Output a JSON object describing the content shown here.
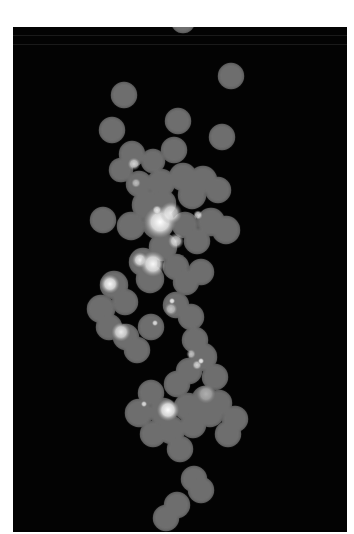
{
  "image": {
    "description": "Grayscale fluorescence-style micrograph: chain of overlapping gray discs with bright highlight spots",
    "background": "#030303",
    "page_background": "#ffffff",
    "disc_color": "#6e6e6e",
    "disc_edge_color": "#5a5a5a",
    "highlight_color": "#f4f4f4",
    "frame": {
      "x": 13,
      "y": 27,
      "width": 334,
      "height": 505
    },
    "scanlines_y": [
      8,
      17
    ]
  },
  "discs": [
    [
      170,
      -6,
      11
    ],
    [
      111,
      68,
      12
    ],
    [
      218,
      49,
      12
    ],
    [
      99,
      103,
      12
    ],
    [
      165,
      94,
      12
    ],
    [
      209,
      110,
      12
    ],
    [
      161,
      123,
      12
    ],
    [
      119,
      127,
      12
    ],
    [
      108,
      143,
      11
    ],
    [
      140,
      134,
      11
    ],
    [
      126,
      157,
      12
    ],
    [
      148,
      156,
      13
    ],
    [
      170,
      150,
      13
    ],
    [
      190,
      153,
      13
    ],
    [
      205,
      163,
      12
    ],
    [
      179,
      168,
      13
    ],
    [
      90,
      193,
      12
    ],
    [
      134,
      178,
      14
    ],
    [
      150,
      176,
      12
    ],
    [
      118,
      199,
      13
    ],
    [
      145,
      196,
      15
    ],
    [
      172,
      198,
      12
    ],
    [
      198,
      195,
      13
    ],
    [
      213,
      203,
      13
    ],
    [
      184,
      214,
      12
    ],
    [
      150,
      220,
      13
    ],
    [
      130,
      235,
      13
    ],
    [
      163,
      240,
      12
    ],
    [
      137,
      252,
      13
    ],
    [
      101,
      258,
      13
    ],
    [
      88,
      282,
      13
    ],
    [
      112,
      275,
      12
    ],
    [
      173,
      255,
      12
    ],
    [
      188,
      245,
      12
    ],
    [
      163,
      278,
      12
    ],
    [
      178,
      290,
      12
    ],
    [
      96,
      300,
      12
    ],
    [
      113,
      310,
      12
    ],
    [
      138,
      300,
      12
    ],
    [
      124,
      323,
      12
    ],
    [
      182,
      313,
      12
    ],
    [
      190,
      330,
      13
    ],
    [
      176,
      344,
      12
    ],
    [
      202,
      350,
      12
    ],
    [
      206,
      376,
      12
    ],
    [
      192,
      372,
      12
    ],
    [
      164,
      357,
      12
    ],
    [
      138,
      366,
      12
    ],
    [
      126,
      386,
      13
    ],
    [
      150,
      385,
      13
    ],
    [
      175,
      380,
      13
    ],
    [
      197,
      386,
      13
    ],
    [
      222,
      392,
      12
    ],
    [
      158,
      403,
      13
    ],
    [
      167,
      422,
      12
    ],
    [
      140,
      407,
      12
    ],
    [
      180,
      398,
      12
    ],
    [
      215,
      407,
      12
    ],
    [
      181,
      452,
      12
    ],
    [
      188,
      463,
      12
    ],
    [
      164,
      478,
      12
    ],
    [
      153,
      491,
      12
    ]
  ],
  "highlights": [
    [
      121,
      137,
      4,
      0.7
    ],
    [
      123,
      156,
      3,
      0.55
    ],
    [
      147,
      195,
      10,
      1.0
    ],
    [
      144,
      183,
      3,
      0.8
    ],
    [
      158,
      186,
      7,
      0.85
    ],
    [
      185,
      188,
      3,
      0.8
    ],
    [
      163,
      214,
      5,
      0.8
    ],
    [
      127,
      233,
      5,
      0.9
    ],
    [
      140,
      237,
      8,
      0.95
    ],
    [
      97,
      257,
      6,
      0.95
    ],
    [
      158,
      282,
      4,
      0.6
    ],
    [
      159,
      274,
      2,
      0.9
    ],
    [
      108,
      305,
      6,
      0.85
    ],
    [
      142,
      296,
      2,
      0.8
    ],
    [
      178,
      327,
      3,
      0.6
    ],
    [
      184,
      338,
      3,
      0.7
    ],
    [
      155,
      383,
      7,
      1.0
    ],
    [
      131,
      377,
      2,
      0.8
    ],
    [
      193,
      367,
      6,
      0.45
    ],
    [
      188,
      334,
      2,
      0.9
    ]
  ]
}
